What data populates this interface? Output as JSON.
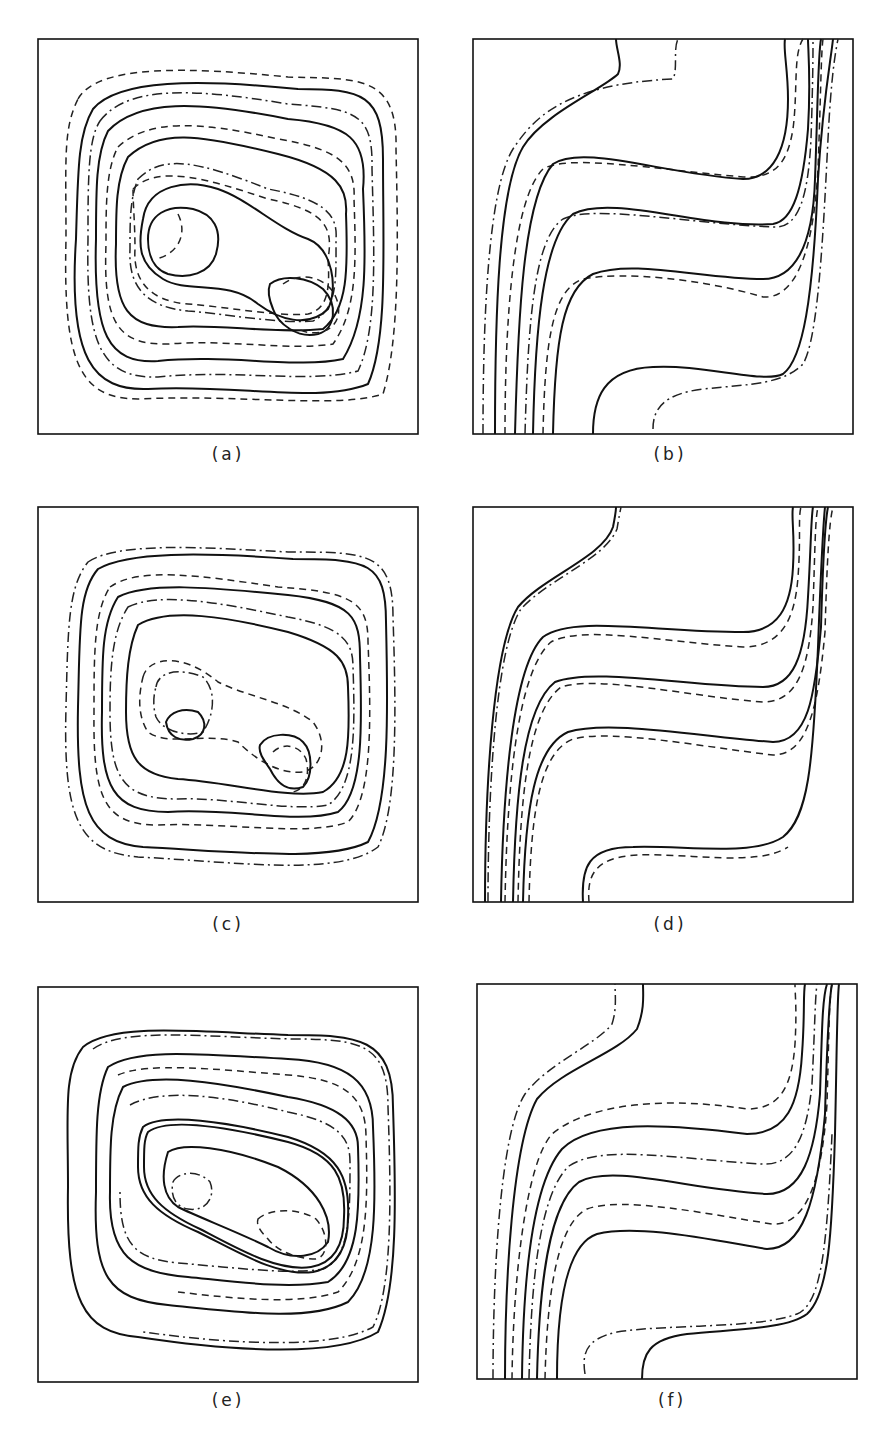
{
  "figure": {
    "panels": [
      {
        "id": "a",
        "label": "(a)",
        "type": "closed-contours-two-vortex"
      },
      {
        "id": "b",
        "label": "(b)",
        "type": "s-shaped-isotherms"
      },
      {
        "id": "c",
        "label": "(c)",
        "type": "closed-contours-two-vortex"
      },
      {
        "id": "d",
        "label": "(d)",
        "type": "s-shaped-isotherms"
      },
      {
        "id": "e",
        "label": "(e)",
        "type": "closed-contours-two-vortex"
      },
      {
        "id": "f",
        "label": "(f)",
        "type": "s-shaped-isotherms"
      }
    ],
    "line_styles": [
      "solid",
      "dashed",
      "dash-dot"
    ],
    "colors": {
      "ink": "#111111",
      "background": "#ffffff"
    }
  }
}
